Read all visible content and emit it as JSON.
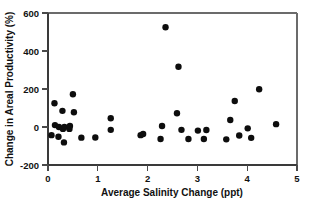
{
  "chart_data": {
    "type": "scatter",
    "title": "",
    "xlabel": "Average Salinity Change (ppt)",
    "ylabel": "Change in Areal Productivity (%)",
    "xlim": [
      0,
      5
    ],
    "ylim": [
      -200,
      600
    ],
    "xticks": [
      0,
      1,
      2,
      3,
      4,
      5
    ],
    "yticks": [
      -200,
      0,
      200,
      400,
      600
    ],
    "xticklabels": [
      "0",
      "1",
      "2",
      "3",
      "4",
      "5"
    ],
    "yticklabels": [
      "-200",
      "0",
      "200",
      "400",
      "600"
    ],
    "grid": false,
    "legend": null,
    "marker": "filled-circle",
    "marker_color": "#0d0d0d",
    "marker_size": 3.2,
    "n_points": 37,
    "points": [
      {
        "x": 0.07,
        "y": -43
      },
      {
        "x": 0.13,
        "y": 125
      },
      {
        "x": 0.14,
        "y": 10
      },
      {
        "x": 0.21,
        "y": -51
      },
      {
        "x": 0.22,
        "y": 0
      },
      {
        "x": 0.29,
        "y": 85
      },
      {
        "x": 0.3,
        "y": -10
      },
      {
        "x": 0.32,
        "y": -81
      },
      {
        "x": 0.33,
        "y": 0
      },
      {
        "x": 0.43,
        "y": -10
      },
      {
        "x": 0.44,
        "y": 5
      },
      {
        "x": 0.5,
        "y": 172
      },
      {
        "x": 0.52,
        "y": 78
      },
      {
        "x": 0.67,
        "y": -56
      },
      {
        "x": 1.26,
        "y": -15
      },
      {
        "x": 1.26,
        "y": 46
      },
      {
        "x": 1.86,
        "y": -43
      },
      {
        "x": 1.91,
        "y": -37
      },
      {
        "x": 2.36,
        "y": 525
      },
      {
        "x": 2.26,
        "y": -63
      },
      {
        "x": 2.62,
        "y": 317
      },
      {
        "x": 2.29,
        "y": 5
      },
      {
        "x": 2.59,
        "y": 72
      },
      {
        "x": 2.68,
        "y": -15
      },
      {
        "x": 2.82,
        "y": -63
      },
      {
        "x": 3.01,
        "y": -19
      },
      {
        "x": 3.13,
        "y": -63
      },
      {
        "x": 3.18,
        "y": -16
      },
      {
        "x": 3.58,
        "y": -65
      },
      {
        "x": 3.66,
        "y": 37
      },
      {
        "x": 3.75,
        "y": 137
      },
      {
        "x": 3.84,
        "y": -45
      },
      {
        "x": 4.01,
        "y": -7
      },
      {
        "x": 4.08,
        "y": -57
      },
      {
        "x": 4.24,
        "y": 199
      },
      {
        "x": 4.58,
        "y": 15
      },
      {
        "x": 0.95,
        "y": -55
      }
    ]
  },
  "layout": {
    "plot_left_px": 48,
    "plot_right_px": 297,
    "plot_top_px": 13,
    "plot_bottom_px": 165
  }
}
